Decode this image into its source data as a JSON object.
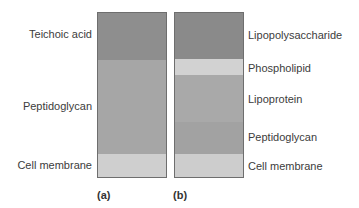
{
  "panel_a": {
    "caption": "(a)",
    "layers": [
      {
        "name": "Teichoic acid",
        "color": "#8e8e8e"
      },
      {
        "name": "Peptidoglycan",
        "color": "#a6a6a6"
      },
      {
        "name": "Cell membrane",
        "color": "#cfcfcf"
      }
    ]
  },
  "panel_b": {
    "caption": "(b)",
    "layers": [
      {
        "name": "Lipopolysaccharide",
        "color": "#8a8a8a"
      },
      {
        "name": "Phospholipid",
        "color": "#d2d2d2"
      },
      {
        "name": "Lipoprotein",
        "color": "#a9a9a9"
      },
      {
        "name": "Peptidoglycan",
        "color": "#a2a2a2"
      },
      {
        "name": "Cell membrane",
        "color": "#cdcdcd"
      }
    ]
  }
}
